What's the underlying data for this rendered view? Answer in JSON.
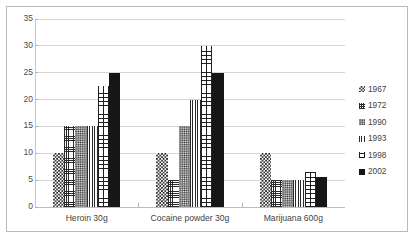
{
  "chart_data": {
    "type": "bar",
    "title": "",
    "subtitle": "",
    "xlabel": "",
    "ylabel": "",
    "categories": [
      "Heroin 30g",
      "Cocaine powder 30g",
      "Marijuana 600g"
    ],
    "series": [
      {
        "name": "1967",
        "pattern": "checker",
        "values": [
          10,
          10,
          10
        ]
      },
      {
        "name": "1972",
        "pattern": "grid",
        "values": [
          15,
          5,
          5
        ]
      },
      {
        "name": "1990",
        "pattern": "dots",
        "values": [
          15,
          15,
          5
        ]
      },
      {
        "name": "1993",
        "pattern": "vstripe",
        "values": [
          15,
          20,
          5
        ]
      },
      {
        "name": "1998",
        "pattern": "brick",
        "values": [
          22.5,
          30,
          6.5
        ]
      },
      {
        "name": "2002",
        "pattern": "solid",
        "values": [
          25,
          25,
          5.5
        ]
      }
    ],
    "ylim": [
      0,
      35
    ],
    "yticks": [
      0,
      5,
      10,
      15,
      20,
      25,
      30,
      35
    ],
    "ytick_labels": [
      "0",
      "5",
      "10",
      "15",
      "20",
      "25",
      "30",
      "35"
    ],
    "grid": true,
    "legend_position": "right",
    "legend_entries": [
      "1967",
      "1972",
      "1990",
      "1993",
      "1998",
      "2002"
    ],
    "colors": {
      "pattern_ink": "#1b1b1b",
      "gridline": "#d5d5d5",
      "axis": "#bdbdbd",
      "frame_border": "#b9b9b9",
      "background": "#ffffff",
      "text": "#3f3f3f"
    }
  }
}
